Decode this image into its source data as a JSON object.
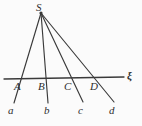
{
  "figure": {
    "kind": "geometry-diagram",
    "background_color": "#fbfbfb",
    "stroke_color": "#3a3a3a",
    "label_color": "#2e2e2e",
    "apex": {
      "name": "S",
      "label": "S",
      "label_x": 36,
      "label_y": 2,
      "point_x": 41,
      "point_y": 13
    },
    "axis": {
      "name": "transversal",
      "label": "ξ",
      "label_x": 127,
      "label_y": 70,
      "x1": 4,
      "y1": 79,
      "x2": 124,
      "y2": 77
    },
    "rays": [
      {
        "name": "ray-a",
        "lower_label": "a",
        "lower_label_x": 8,
        "lower_label_y": 105,
        "intersection_label": "A",
        "intersection_label_x": 14,
        "intersection_label_y": 81,
        "x1": 41,
        "y1": 13,
        "x2": 14,
        "y2": 103,
        "cross_x": 20,
        "cross_y": 79
      },
      {
        "name": "ray-b",
        "lower_label": "b",
        "lower_label_x": 44,
        "lower_label_y": 105,
        "intersection_label": "B",
        "intersection_label_x": 38,
        "intersection_label_y": 81,
        "x1": 41,
        "y1": 13,
        "x2": 48,
        "y2": 103,
        "cross_x": 44,
        "cross_y": 78
      },
      {
        "name": "ray-c",
        "lower_label": "c",
        "lower_label_x": 78,
        "lower_label_y": 105,
        "intersection_label": "C",
        "intersection_label_x": 64,
        "intersection_label_y": 81,
        "x1": 41,
        "y1": 13,
        "x2": 83,
        "y2": 102,
        "cross_x": 70,
        "cross_y": 78
      },
      {
        "name": "ray-d",
        "lower_label": "d",
        "lower_label_x": 109,
        "lower_label_y": 105,
        "intersection_label": "D",
        "intersection_label_x": 90,
        "intersection_label_y": 81,
        "x1": 41,
        "y1": 13,
        "x2": 114,
        "y2": 102,
        "cross_x": 96,
        "cross_y": 77
      }
    ]
  }
}
